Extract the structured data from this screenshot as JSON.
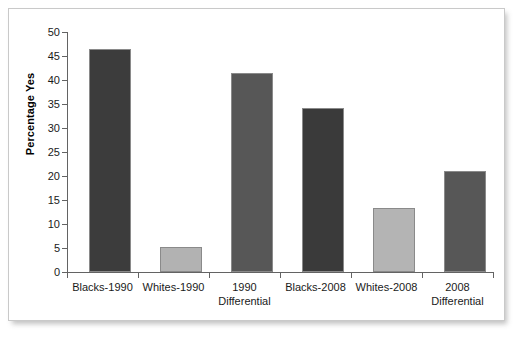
{
  "chart_data": {
    "type": "bar",
    "title": "",
    "xlabel": "",
    "ylabel": "Percentage Yes",
    "ylim": [
      0,
      50
    ],
    "ytick_step": 5,
    "yticks": [
      50,
      45,
      40,
      35,
      30,
      25,
      20,
      15,
      10,
      5,
      0
    ],
    "grid": false,
    "legend": "none",
    "categories": [
      "Blacks-1990",
      "Whites-1990",
      "1990 Differential",
      "Blacks-2008",
      "Whites-2008",
      "2008 Differential"
    ],
    "category_lines": [
      [
        "Blacks-1990",
        ""
      ],
      [
        "Whites-1990",
        ""
      ],
      [
        "1990",
        "Differential"
      ],
      [
        "Blacks-2008",
        ""
      ],
      [
        "Whites-2008",
        ""
      ],
      [
        "2008",
        "Differential"
      ]
    ],
    "values": [
      46.5,
      5.2,
      41.5,
      34.2,
      13.3,
      21.0
    ],
    "bar_colors": [
      "#3c3c3c",
      "#b2b2b2",
      "#575757",
      "#3a3a3a",
      "#b4b4b4",
      "#575757"
    ]
  },
  "axis": {
    "y_title": "Percentage Yes",
    "tick_50": "50",
    "tick_45": "45",
    "tick_40": "40",
    "tick_35": "35",
    "tick_30": "30",
    "tick_25": "25",
    "tick_20": "20",
    "tick_15": "15",
    "tick_10": "10",
    "tick_5": "5",
    "tick_0": "0"
  },
  "labels": {
    "cat1_l1": "Blacks-1990",
    "cat1_l2": "",
    "cat2_l1": "Whites-1990",
    "cat2_l2": "",
    "cat3_l1": "1990",
    "cat3_l2": "Differential",
    "cat4_l1": "Blacks-2008",
    "cat4_l2": "",
    "cat5_l1": "Whites-2008",
    "cat5_l2": "",
    "cat6_l1": "2008",
    "cat6_l2": "Differential"
  },
  "colors": {
    "bar_dark": "#3c3c3c",
    "bar_light": "#b2b2b2",
    "bar_medium": "#575757",
    "axis": "#636363",
    "frame_border": "#c9c9c9",
    "text": "#1a1a1a",
    "background": "#ffffff"
  }
}
